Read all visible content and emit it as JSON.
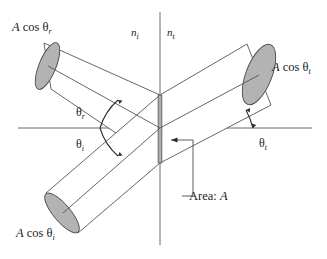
{
  "figure": {
    "background_color": "#ffffff",
    "line_color": "#555555",
    "axis_color": "#6b6b6b",
    "cap_fill_color": "#b3b3b3",
    "area_strip_color": "#b0b0b0",
    "text_color": "#1a1a1a"
  },
  "labels": {
    "reflected_beam": {
      "prefix": "A",
      "cos": " cos ",
      "theta": "θ",
      "subscript": "r"
    },
    "incident_beam": {
      "prefix": "A",
      "cos": " cos ",
      "theta": "θ",
      "subscript": "i"
    },
    "transmitted_beam": {
      "prefix": "A",
      "cos": " cos ",
      "theta": "θ",
      "subscript": "t"
    },
    "index_incident": {
      "symbol": "n",
      "subscript": "i"
    },
    "index_transmitted": {
      "symbol": "n",
      "subscript": "t"
    },
    "angle_reflected": {
      "theta": "θ",
      "subscript": "r"
    },
    "angle_incident": {
      "theta": "θ",
      "subscript": "i"
    },
    "angle_transmitted": {
      "theta": "θ",
      "subscript": "t"
    },
    "area_callout": {
      "text": "Area: ",
      "symbol": "A"
    }
  },
  "geometry": {
    "interface_x": 160,
    "interface_top_y": 95,
    "interface_bottom_y": 163,
    "horizontal_axis_y": 128,
    "vertical_axis_top_y": 12,
    "vertical_axis_bottom_y": 245,
    "horizontal_axis_x1": 18,
    "horizontal_axis_x2": 312,
    "angle_incident_deg": 42,
    "angle_reflected_deg": 42,
    "angle_transmitted_deg": 20
  }
}
